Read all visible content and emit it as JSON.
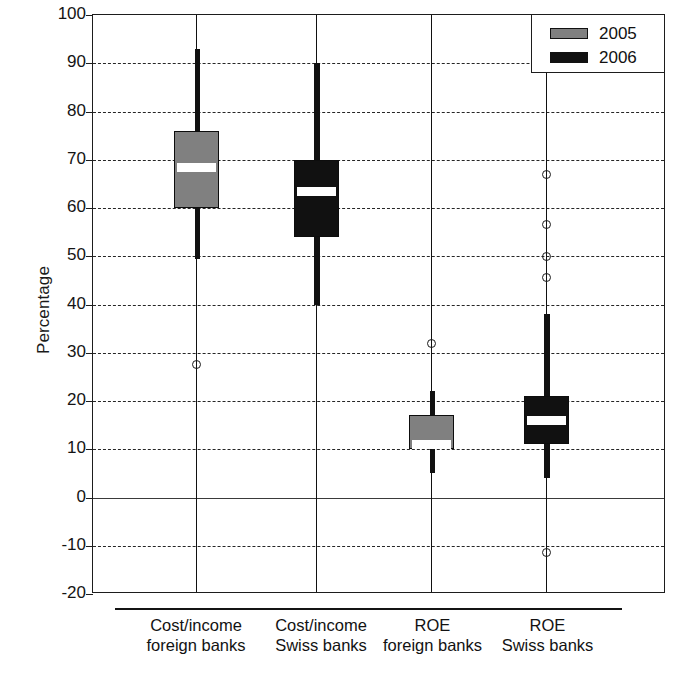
{
  "chart_data": {
    "type": "box",
    "title": "",
    "xlabel": "",
    "ylabel": "Percentage",
    "ylim": [
      -20,
      100
    ],
    "ytick_labels": [
      "100",
      "90",
      "80",
      "70",
      "60",
      "50",
      "40",
      "30",
      "20",
      "10",
      "0",
      "-10",
      "-20"
    ],
    "yticks": [
      100,
      90,
      80,
      70,
      60,
      50,
      40,
      30,
      20,
      10,
      0,
      -10,
      -20
    ],
    "grid": true,
    "grid_style": "dashed-horizontal",
    "legend_position": "top-right",
    "legend": [
      {
        "label": "2005",
        "color": "#808080"
      },
      {
        "label": "2006",
        "color": "#111111"
      }
    ],
    "categories": [
      {
        "line1": "Cost/income",
        "line2": "foreign banks"
      },
      {
        "line1": "Cost/income",
        "line2": "Swiss banks"
      },
      {
        "line1": "ROE",
        "line2": "foreign banks"
      },
      {
        "line1": "ROE",
        "line2": "Swiss banks"
      }
    ],
    "boxes": [
      {
        "category": "Cost/income foreign banks",
        "series": "2005",
        "color": "#808080",
        "whisker_low": 49.5,
        "q1": 60.0,
        "median": 68.5,
        "q3": 76.0,
        "whisker_high": 93.0,
        "outliers": [
          27.5
        ]
      },
      {
        "category": "Cost/income Swiss banks",
        "series": "2006",
        "color": "#111111",
        "whisker_low": 40.0,
        "q1": 54.0,
        "median": 63.5,
        "q3": 70.0,
        "whisker_high": 90.0,
        "outliers": []
      },
      {
        "category": "ROE foreign banks",
        "series": "2005",
        "color": "#808080",
        "whisker_low": 5.0,
        "q1": 10.0,
        "median": 11.0,
        "q3": 17.0,
        "whisker_high": 22.0,
        "outliers": [
          32.0
        ]
      },
      {
        "category": "ROE Swiss banks",
        "series": "2006",
        "color": "#111111",
        "whisker_low": 4.0,
        "q1": 11.0,
        "median": 16.0,
        "q3": 21.0,
        "whisker_high": 38.0,
        "outliers": [
          67.0,
          56.5,
          50.0,
          45.5,
          -11.5
        ]
      }
    ]
  }
}
